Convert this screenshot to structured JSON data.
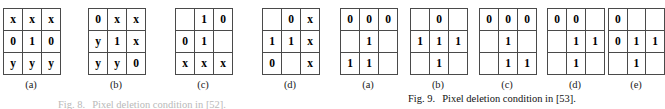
{
  "figures": [
    {
      "id": "figure-left",
      "caption_number": "Fig. 8.",
      "caption_text": "Pixel deletion condition in [52].",
      "panels": [
        {
          "label": "(a)",
          "x": 3,
          "rows": [
            [
              "x",
              "x",
              "x"
            ],
            [
              "0",
              "1",
              "0"
            ],
            [
              "y",
              "y",
              "y"
            ]
          ]
        },
        {
          "label": "(b)",
          "x": 88,
          "rows": [
            [
              "0",
              "x",
              "x"
            ],
            [
              "y",
              "1",
              "x"
            ],
            [
              "y",
              "y",
              "0"
            ]
          ]
        },
        {
          "label": "(c)",
          "x": 175,
          "rows": [
            [
              "",
              "1",
              "0"
            ],
            [
              "0",
              "1",
              ""
            ],
            [
              "x",
              "x",
              "x"
            ]
          ]
        },
        {
          "label": "(d)",
          "x": 262,
          "rows": [
            [
              "",
              "0",
              "x"
            ],
            [
              "1",
              "1",
              "x"
            ],
            [
              "0",
              "",
              "x"
            ]
          ]
        }
      ]
    },
    {
      "id": "figure-right",
      "caption_number": "Fig. 9.",
      "caption_text": "Pixel deletion condition in [53].",
      "panels": [
        {
          "label": "(a)",
          "x": 340,
          "rows": [
            [
              "0",
              "0",
              "0"
            ],
            [
              "",
              "1",
              ""
            ],
            [
              "1",
              "1",
              ""
            ]
          ]
        },
        {
          "label": "(b)",
          "x": 410,
          "rows": [
            [
              "",
              "0",
              ""
            ],
            [
              "1",
              "1",
              "1"
            ],
            [
              "",
              "1",
              ""
            ]
          ]
        },
        {
          "label": "(c)",
          "x": 479,
          "rows": [
            [
              "0",
              "0",
              "0"
            ],
            [
              "",
              "1",
              ""
            ],
            [
              "",
              "1",
              "1"
            ]
          ]
        },
        {
          "label": "(d)",
          "x": 547,
          "rows": [
            [
              "0",
              "0",
              ""
            ],
            [
              "",
              "1",
              "1"
            ],
            [
              "",
              "1",
              ""
            ]
          ]
        },
        {
          "label": "(e)",
          "x": 608,
          "rows": [
            [
              "0",
              "",
              ""
            ],
            [
              "0",
              "1",
              "1"
            ],
            [
              "",
              "1",
              ""
            ]
          ]
        }
      ]
    }
  ]
}
